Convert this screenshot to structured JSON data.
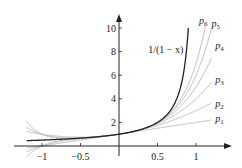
{
  "chart_data": {
    "type": "line",
    "title": "",
    "xlabel": "",
    "ylabel": "",
    "xlim": [
      -1.25,
      1.3
    ],
    "ylim": [
      -0.5,
      10.8
    ],
    "grid": false,
    "x_ticks": [
      {
        "value": -1,
        "label": "−1"
      },
      {
        "value": -0.5,
        "label": "−0.5"
      },
      {
        "value": 0.5,
        "label": "0.5"
      },
      {
        "value": 1,
        "label": "1"
      }
    ],
    "y_ticks": [
      {
        "value": 2,
        "label": "2"
      },
      {
        "value": 4,
        "label": "4"
      },
      {
        "value": 6,
        "label": "6"
      },
      {
        "value": 8,
        "label": "8"
      },
      {
        "value": 10,
        "label": "10"
      }
    ],
    "series": [
      {
        "name": "1/(1 − x)",
        "formula": "1/(1-x)",
        "x_range": [
          -1.2,
          0.9
        ],
        "color": "#222222",
        "width": 1.3
      },
      {
        "name": "p1",
        "formula": "1+x",
        "degree": 1,
        "x_range": [
          -1.2,
          1.2
        ],
        "color": "#b8b8b8",
        "width": 0.9
      },
      {
        "name": "p2",
        "formula": "1+x+x^2",
        "degree": 2,
        "x_range": [
          -1.2,
          1.2
        ],
        "color": "#b8b8b8",
        "width": 0.9
      },
      {
        "name": "p3",
        "formula": "1+x+x^2+x^3",
        "degree": 3,
        "x_range": [
          -1.2,
          1.2
        ],
        "color": "#b8b8b8",
        "width": 0.9
      },
      {
        "name": "p4",
        "formula": "1+x+...+x^4",
        "degree": 4,
        "x_range": [
          -1.2,
          1.2
        ],
        "color": "#b8b8b8",
        "width": 0.9
      },
      {
        "name": "p5",
        "formula": "1+x+...+x^5",
        "degree": 5,
        "x_range": [
          -1.2,
          1.2
        ],
        "color": "#b8b8b8",
        "width": 0.9
      },
      {
        "name": "p6",
        "formula": "1+x+...+x^6",
        "degree": 6,
        "x_range": [
          -1.2,
          1.2
        ],
        "color": "#b8b8b8",
        "width": 0.9
      }
    ],
    "annotations": [
      {
        "text": "1/(1 − x)",
        "x": 0.38,
        "y": 7.9
      },
      {
        "text": "p6",
        "x": 1.04,
        "y": 10.3
      },
      {
        "text": "p5",
        "x": 1.2,
        "y": 10.1
      },
      {
        "text": "p4",
        "x": 1.25,
        "y": 8.2
      },
      {
        "text": "p3",
        "x": 1.25,
        "y": 5.3
      },
      {
        "text": "p2",
        "x": 1.25,
        "y": 3.3
      },
      {
        "text": "p1",
        "x": 1.25,
        "y": 2.0
      }
    ]
  }
}
